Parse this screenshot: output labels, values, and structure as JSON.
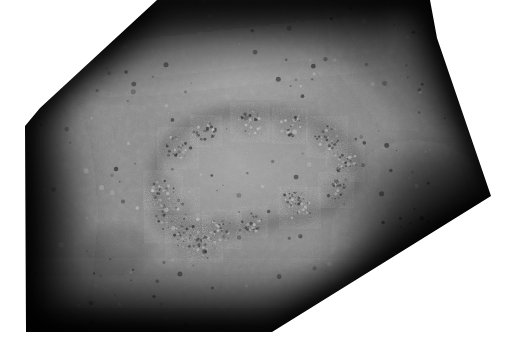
{
  "image": {
    "kind": "clinical-photograph",
    "subject": "skin-lesion",
    "modality": "dermatology-macro-photo",
    "color_mode": "grayscale",
    "canvas_width": 509,
    "canvas_height": 353,
    "background_color": "#ffffff",
    "alt_text": "Grayscale close-up clinical photograph of skin showing a large irregular plaque lesion with a raised scaly border, cropped to an irregular polygon with strong vignetting at the edges.",
    "crop_shape": "irregular-polygon",
    "crop_vertices": [
      [
        157,
        0
      ],
      [
        430,
        0
      ],
      [
        437,
        38
      ],
      [
        491,
        196
      ],
      [
        272,
        332
      ],
      [
        26,
        332
      ],
      [
        25,
        126
      ],
      [
        40,
        108
      ]
    ]
  },
  "tones": {
    "skin_midtone": "#8e8e8e",
    "skin_highlight": "#b4b4b4",
    "skin_shadow": "#3a3a3a",
    "vignette_edge": "#111111",
    "lesion_center": "#8a8a8a",
    "lesion_border": "#6a6a6a",
    "speck_dark": "#2b2b2b",
    "speck_light": "#c9c9c9"
  },
  "regions": [
    {
      "name": "upper-highlight-band",
      "label": "Diffuse bright band across upper skin",
      "cx": 230,
      "cy": 70,
      "rx": 175,
      "ry": 72,
      "tone": "#a9a9a9"
    },
    {
      "name": "central-plaque",
      "label": "Central lesion plaque, lighter than surrounding skin",
      "cx": 245,
      "cy": 175,
      "rx": 125,
      "ry": 78,
      "tone": "#989898"
    },
    {
      "name": "left-shadow",
      "label": "Deep shadow along left flank",
      "cx": 45,
      "cy": 215,
      "rx": 70,
      "ry": 135,
      "tone": "#1c1c1c"
    },
    {
      "name": "right-shadow",
      "label": "Deep shadow along lower right flank",
      "cx": 415,
      "cy": 245,
      "rx": 95,
      "ry": 105,
      "tone": "#161616"
    },
    {
      "name": "bottom-shadow",
      "label": "Shadow gradient along bottom",
      "cx": 180,
      "cy": 325,
      "rx": 185,
      "ry": 60,
      "tone": "#242424"
    },
    {
      "name": "top-shadow",
      "label": "Shadow gradient along top-left diagonal",
      "cx": 185,
      "cy": 18,
      "rx": 110,
      "ry": 45,
      "tone": "#1e1e1e"
    }
  ],
  "lesion": {
    "name": "plaque-outline",
    "label": "Scaly annular lesion border",
    "path": "M 160 198 C 150 180 156 158 170 142 C 188 122 218 112 248 112 C 284 112 312 120 330 132 C 350 145 362 160 358 176 C 354 194 336 206 312 213 C 286 221 252 226 222 229 C 198 231 176 224 166 214 Z",
    "crust_patches": [
      {
        "cx": 172,
        "cy": 215,
        "r": 17
      },
      {
        "cx": 188,
        "cy": 238,
        "r": 14
      },
      {
        "cx": 205,
        "cy": 245,
        "r": 11
      },
      {
        "cx": 163,
        "cy": 190,
        "r": 12
      },
      {
        "cx": 178,
        "cy": 148,
        "r": 13
      },
      {
        "cx": 206,
        "cy": 131,
        "r": 10
      },
      {
        "cx": 250,
        "cy": 122,
        "r": 12
      },
      {
        "cx": 290,
        "cy": 126,
        "r": 11
      },
      {
        "cx": 327,
        "cy": 137,
        "r": 13
      },
      {
        "cx": 345,
        "cy": 162,
        "r": 12
      },
      {
        "cx": 336,
        "cy": 190,
        "r": 11
      },
      {
        "cx": 300,
        "cy": 208,
        "r": 13
      },
      {
        "cx": 252,
        "cy": 222,
        "r": 10
      },
      {
        "cx": 222,
        "cy": 229,
        "r": 12
      },
      {
        "cx": 292,
        "cy": 200,
        "r": 9
      }
    ]
  },
  "secondary_spots": [
    {
      "cx": 300,
      "cy": 207,
      "rx": 22,
      "ry": 16,
      "tone": "#9d9d9d"
    },
    {
      "cx": 196,
      "cy": 155,
      "rx": 26,
      "ry": 18,
      "tone": "#9c9c9c"
    },
    {
      "cx": 264,
      "cy": 152,
      "rx": 20,
      "ry": 14,
      "tone": "#9a9a9a"
    },
    {
      "cx": 352,
      "cy": 104,
      "rx": 30,
      "ry": 20,
      "tone": "#8d8d8d"
    },
    {
      "cx": 118,
      "cy": 250,
      "rx": 34,
      "ry": 24,
      "tone": "#5e5e5e"
    }
  ],
  "pores": {
    "label": "Follicular openings and pigment specks",
    "count": 260,
    "size_min": 0.6,
    "size_max": 2.6
  }
}
